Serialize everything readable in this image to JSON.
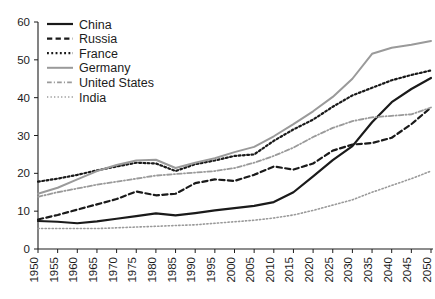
{
  "chart_data": {
    "type": "line",
    "title": "",
    "subtitle": "",
    "xlabel": "",
    "ylabel": "",
    "xlim": [
      1950,
      2050
    ],
    "ylim": [
      0,
      60
    ],
    "grid": false,
    "legend_position": "top-left",
    "x": [
      1950,
      1955,
      1960,
      1965,
      1970,
      1975,
      1980,
      1985,
      1990,
      1995,
      2000,
      2005,
      2010,
      2015,
      2020,
      2025,
      2030,
      2035,
      2040,
      2045,
      2050
    ],
    "xtick_labels": [
      "1950",
      "1955",
      "1960",
      "1965",
      "1970",
      "1975",
      "1980",
      "1985",
      "1990",
      "1995",
      "2000",
      "2005",
      "2010",
      "2015",
      "2020",
      "2025",
      "2030",
      "2035",
      "2040",
      "2045",
      "2050"
    ],
    "ytick_labels": [
      "0",
      "10",
      "20",
      "30",
      "40",
      "50",
      "60"
    ],
    "yticks": [
      0,
      10,
      20,
      30,
      40,
      50,
      60
    ],
    "series": [
      {
        "name": "China",
        "style": "solid",
        "color": "#1a1a1a",
        "width": 2.2,
        "values": [
          7.4,
          7.2,
          6.8,
          7.3,
          8.0,
          8.7,
          9.4,
          8.9,
          9.5,
          10.2,
          10.8,
          11.4,
          12.4,
          15.0,
          19.2,
          23.5,
          27.2,
          33.5,
          38.8,
          42.3,
          45.2
        ]
      },
      {
        "name": "Russia",
        "style": "dashed",
        "color": "#1a1a1a",
        "width": 2.2,
        "values": [
          7.8,
          9.0,
          10.4,
          11.8,
          13.2,
          15.2,
          14.2,
          14.6,
          17.4,
          18.4,
          18.0,
          19.6,
          21.8,
          21.0,
          22.6,
          26.0,
          27.6,
          28.0,
          29.4,
          33.0,
          37.4
        ]
      },
      {
        "name": "France",
        "style": "dotted",
        "color": "#1a1a1a",
        "width": 2.2,
        "values": [
          17.8,
          18.6,
          19.6,
          20.8,
          21.8,
          22.8,
          22.6,
          20.6,
          22.4,
          23.4,
          24.6,
          25.0,
          28.6,
          31.6,
          34.2,
          37.6,
          40.6,
          42.6,
          44.6,
          46.0,
          47.2
        ]
      },
      {
        "name": "Germany",
        "style": "solid",
        "color": "#9a9a9a",
        "width": 2.0,
        "values": [
          14.6,
          16.2,
          18.4,
          20.6,
          22.2,
          23.4,
          23.6,
          21.4,
          22.8,
          24.0,
          25.6,
          27.0,
          29.8,
          33.0,
          36.4,
          40.2,
          45.0,
          51.6,
          53.2,
          54.0,
          55.0
        ]
      },
      {
        "name": "United States",
        "style": "dashdot",
        "color": "#9a9a9a",
        "width": 1.8,
        "values": [
          13.8,
          15.0,
          16.0,
          17.0,
          17.8,
          18.6,
          19.4,
          19.8,
          20.2,
          20.6,
          21.4,
          22.8,
          24.6,
          26.8,
          29.6,
          32.0,
          33.8,
          34.8,
          35.2,
          35.6,
          37.4
        ]
      },
      {
        "name": "India",
        "style": "dotted-fine",
        "color": "#9a9a9a",
        "width": 1.6,
        "values": [
          5.4,
          5.4,
          5.4,
          5.4,
          5.6,
          5.8,
          6.0,
          6.2,
          6.4,
          6.8,
          7.2,
          7.6,
          8.2,
          9.0,
          10.2,
          11.6,
          13.0,
          15.0,
          16.8,
          18.6,
          20.6
        ]
      }
    ]
  },
  "legend": {
    "items": [
      {
        "label": "China"
      },
      {
        "label": "Russia"
      },
      {
        "label": "France"
      },
      {
        "label": "Germany"
      },
      {
        "label": "United States"
      },
      {
        "label": "India"
      }
    ]
  }
}
